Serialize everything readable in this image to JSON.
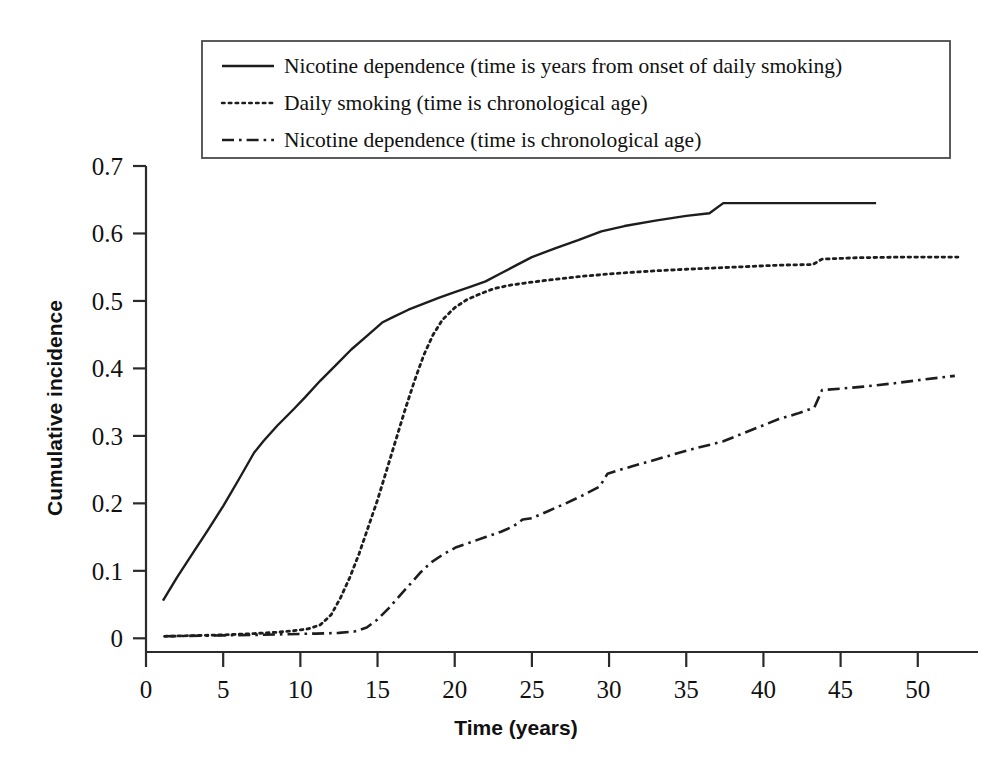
{
  "chart_data": {
    "type": "line",
    "title": "",
    "xlabel": "Time (years)",
    "ylabel": "Cumulative incidence",
    "xlim": [
      0,
      52.8
    ],
    "ylim": [
      0,
      0.7
    ],
    "grid": false,
    "legend_position": "top-center",
    "xticks": [
      0,
      5,
      10,
      15,
      20,
      25,
      30,
      35,
      40,
      45,
      50
    ],
    "xtick_labels": [
      "0",
      "5",
      "10",
      "15",
      "20",
      "25",
      "30",
      "35",
      "40",
      "45",
      "50"
    ],
    "yticks": [
      0,
      0.1,
      0.2,
      0.3,
      0.4,
      0.5,
      0.6,
      0.7
    ],
    "ytick_labels": [
      "0",
      "0.1",
      "0.2",
      "0.3",
      "0.4",
      "0.5",
      "0.6",
      "0.7"
    ],
    "series": [
      {
        "name": "Nicotine dependence (time is years from onset of daily smoking)",
        "style": "solid",
        "color": "#1d1d1d",
        "x": [
          1.1,
          2.0,
          3.0,
          4.0,
          5.0,
          6.0,
          7.0,
          7.6,
          8.5,
          9.5,
          10.3,
          11.3,
          12.3,
          13.3,
          14.3,
          15.3,
          16.0,
          17.0,
          18.0,
          19.0,
          20.0,
          21.0,
          22.0,
          23.0,
          24.0,
          25.0,
          26.5,
          28.0,
          29.5,
          31.0,
          33.0,
          35.0,
          36.5,
          37.4,
          40.0,
          43.0,
          47.3
        ],
        "y": [
          0.056,
          0.09,
          0.125,
          0.16,
          0.196,
          0.235,
          0.275,
          0.292,
          0.315,
          0.338,
          0.357,
          0.382,
          0.405,
          0.428,
          0.448,
          0.468,
          0.476,
          0.487,
          0.496,
          0.505,
          0.513,
          0.521,
          0.529,
          0.541,
          0.553,
          0.565,
          0.578,
          0.59,
          0.603,
          0.611,
          0.619,
          0.626,
          0.63,
          0.645,
          0.645,
          0.645,
          0.645
        ]
      },
      {
        "name": "Daily smoking (time is chronological age)",
        "style": "dotted",
        "color": "#1d1d1d",
        "x": [
          1.2,
          3.0,
          5.0,
          7.0,
          8.5,
          9.5,
          10.5,
          11.3,
          12.0,
          12.6,
          13.2,
          13.8,
          14.4,
          15.0,
          15.6,
          16.2,
          16.8,
          17.4,
          18.0,
          18.6,
          19.2,
          20.0,
          20.8,
          21.6,
          22.5,
          23.5,
          25.0,
          26.5,
          28.0,
          30.0,
          32.5,
          35.0,
          38.0,
          41.0,
          43.2,
          43.8,
          46.0,
          49.0,
          52.6
        ],
        "y": [
          0.003,
          0.004,
          0.005,
          0.007,
          0.009,
          0.011,
          0.014,
          0.02,
          0.035,
          0.06,
          0.09,
          0.125,
          0.165,
          0.205,
          0.25,
          0.295,
          0.34,
          0.382,
          0.42,
          0.45,
          0.472,
          0.49,
          0.502,
          0.51,
          0.518,
          0.523,
          0.528,
          0.532,
          0.536,
          0.54,
          0.544,
          0.547,
          0.55,
          0.553,
          0.554,
          0.562,
          0.564,
          0.565,
          0.565
        ]
      },
      {
        "name": "Nicotine dependence (time is chronological age)",
        "style": "dashdot",
        "color": "#1d1d1d",
        "x": [
          1.2,
          4.0,
          7.0,
          9.0,
          11.0,
          12.5,
          13.5,
          14.3,
          15.0,
          15.7,
          16.4,
          17.1,
          17.8,
          18.5,
          19.3,
          20.1,
          21.0,
          22.0,
          23.0,
          23.8,
          24.4,
          25.0,
          26.0,
          27.2,
          28.4,
          29.4,
          29.9,
          30.6,
          31.5,
          32.6,
          33.8,
          35.0,
          36.2,
          37.4,
          38.6,
          39.8,
          41.0,
          42.2,
          43.3,
          43.8,
          45.0,
          46.5,
          48.5,
          50.5,
          52.4
        ],
        "y": [
          0.003,
          0.004,
          0.005,
          0.006,
          0.007,
          0.008,
          0.01,
          0.016,
          0.028,
          0.044,
          0.062,
          0.08,
          0.098,
          0.113,
          0.125,
          0.135,
          0.142,
          0.15,
          0.158,
          0.166,
          0.176,
          0.178,
          0.188,
          0.2,
          0.213,
          0.225,
          0.244,
          0.249,
          0.255,
          0.262,
          0.27,
          0.278,
          0.285,
          0.292,
          0.303,
          0.314,
          0.325,
          0.333,
          0.342,
          0.368,
          0.37,
          0.373,
          0.378,
          0.384,
          0.389
        ]
      }
    ]
  },
  "legend": {
    "entries": [
      {
        "label": "Nicotine dependence (time is years from onset of daily smoking)",
        "style": "solid"
      },
      {
        "label": "Daily smoking (time is chronological age)",
        "style": "dotted"
      },
      {
        "label": "Nicotine dependence (time is chronological age)",
        "style": "dashdot"
      }
    ]
  },
  "colors": {
    "background": "#ffffff",
    "ink": "#1d1d1d",
    "axis": "#2b2b2b",
    "legend_border": "#4a4a4a"
  }
}
